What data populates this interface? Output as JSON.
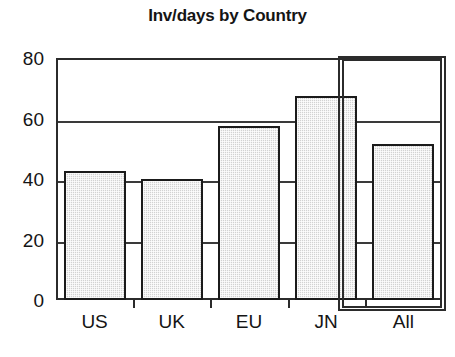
{
  "chart_data": {
    "type": "bar",
    "title": "Inv/days by Country",
    "xlabel": "",
    "ylabel": "",
    "categories": [
      "US",
      "UK",
      "EU",
      "JN",
      "All"
    ],
    "values": [
      42.5,
      40,
      57.5,
      67.5,
      51.5
    ],
    "ylim": [
      0,
      80
    ],
    "yticks": [
      0,
      20,
      40,
      60,
      80
    ],
    "ytick_labels": [
      "0",
      "20",
      "40",
      "60",
      "80"
    ],
    "grid": true,
    "legend": null,
    "annotations": [
      {
        "name": "all-highlight-box",
        "type": "rectangle",
        "target_category": "All",
        "description": "double-line rectangle outlining the All column"
      }
    ],
    "colors": {
      "bar_fill": "#d2d2d2",
      "bar_border": "#1b1b1b",
      "axis": "#2b2b2b",
      "grid": "#3a3a3a",
      "text": "#151515",
      "background": "#ffffff"
    }
  }
}
